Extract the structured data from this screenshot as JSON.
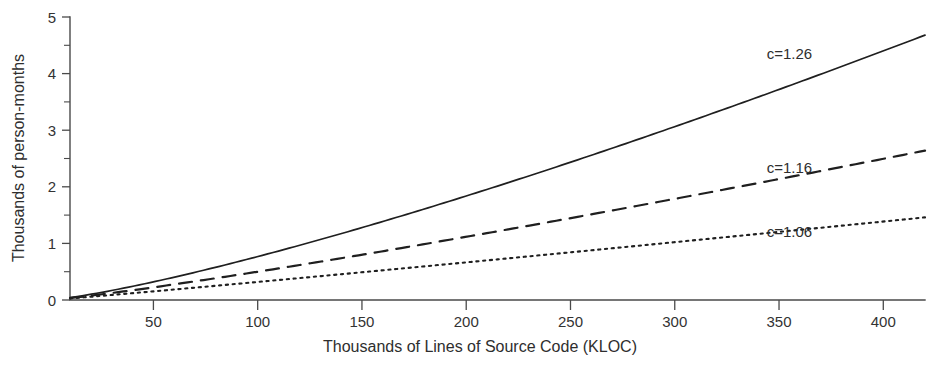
{
  "chart_data": {
    "type": "line",
    "title": "",
    "xlabel": "Thousands of Lines of Source Code (KLOC)",
    "ylabel": "Thousands of person-months",
    "xlim": [
      10,
      420
    ],
    "ylim": [
      0,
      5
    ],
    "xticks": [
      50,
      100,
      150,
      200,
      250,
      300,
      350,
      400
    ],
    "xtick_labels": [
      "50",
      "100",
      "150",
      "200",
      "250",
      "300",
      "350",
      "400"
    ],
    "yticks": [
      0,
      1,
      2,
      3,
      4,
      5
    ],
    "ytick_labels": [
      "0",
      "1",
      "2",
      "3",
      "4",
      "5"
    ],
    "y_minor_ticks": [
      0.5,
      1.5,
      2.5,
      3.5,
      4.5
    ],
    "grid": false,
    "legend_position": "inline-right-of-curves",
    "model": "effort = a * KLOC^c  (thousands of person-months)",
    "series": [
      {
        "name": "c=1.26",
        "label": "c=1.26",
        "exponent": 1.26,
        "style": "solid",
        "color": "#1f1f1f",
        "label_x": 355,
        "label_y": 4.35,
        "x": [
          10,
          50,
          100,
          150,
          200,
          250,
          300,
          350,
          400,
          420
        ],
        "values": [
          0.04,
          0.27,
          0.65,
          1.08,
          1.55,
          2.04,
          2.55,
          3.08,
          3.62,
          4.68
        ]
      },
      {
        "name": "c=1.16",
        "label": "c=1.16",
        "exponent": 1.16,
        "style": "dashed",
        "color": "#1f1f1f",
        "label_x": 355,
        "label_y": 2.33,
        "x": [
          10,
          50,
          100,
          150,
          200,
          250,
          300,
          350,
          400,
          420
        ],
        "values": [
          0.03,
          0.18,
          0.41,
          0.66,
          0.92,
          1.19,
          1.47,
          1.75,
          2.04,
          2.64
        ]
      },
      {
        "name": "c=1.06",
        "label": "c=1.06",
        "exponent": 1.06,
        "style": "dotted",
        "color": "#1f1f1f",
        "label_x": 355,
        "label_y": 1.2,
        "x": [
          10,
          50,
          100,
          150,
          200,
          250,
          300,
          350,
          400,
          420
        ],
        "values": [
          0.02,
          0.12,
          0.25,
          0.39,
          0.53,
          0.67,
          0.81,
          0.96,
          1.11,
          1.46
        ]
      }
    ]
  },
  "axes": {
    "x_axis_name": "x-axis",
    "y_axis_name": "y-axis"
  }
}
